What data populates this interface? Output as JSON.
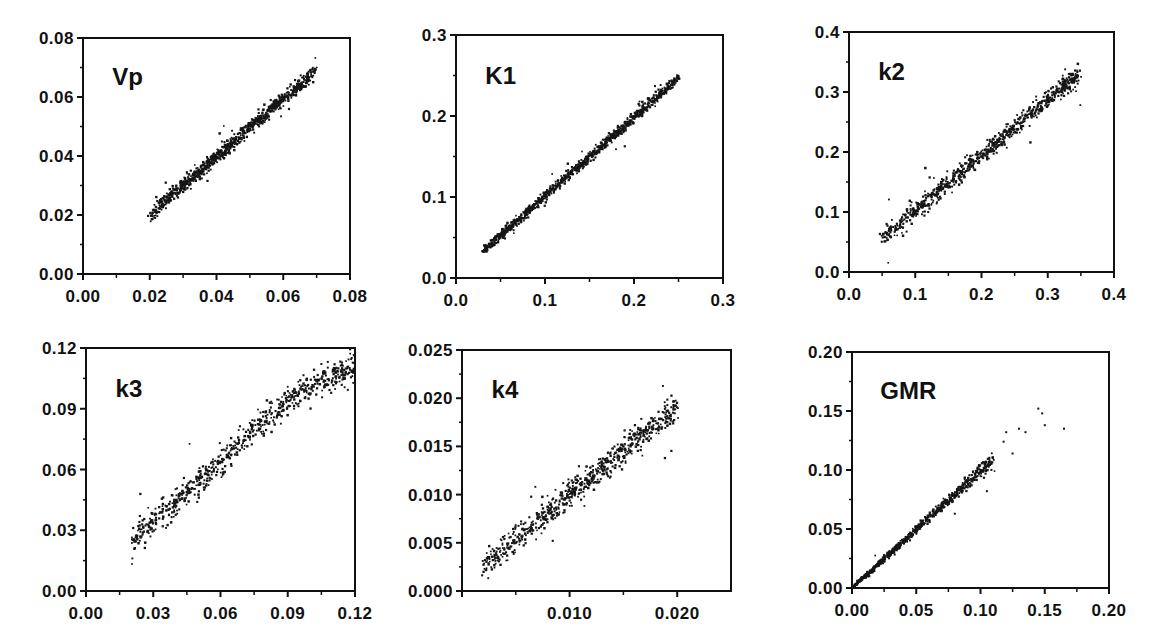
{
  "chart_data": [
    {
      "id": "vp",
      "type": "scatter",
      "title": "Vp",
      "box": [
        83,
        38,
        350,
        274
      ],
      "xlim": [
        0.0,
        0.08
      ],
      "ylim": [
        0.0,
        0.08
      ],
      "xticks": [
        0.0,
        0.02,
        0.04,
        0.06,
        0.08
      ],
      "xtick_labels": [
        "0.00",
        "0.02",
        "0.04",
        "0.06",
        "0.08"
      ],
      "yticks": [
        0.0,
        0.02,
        0.04,
        0.06,
        0.08
      ],
      "ytick_labels": [
        "0.00",
        "0.02",
        "0.04",
        "0.06",
        "0.08"
      ],
      "minor_x": [
        0.01,
        0.03,
        0.05,
        0.07
      ],
      "minor_y": [
        0.01,
        0.03,
        0.05,
        0.07
      ],
      "xlabel": "",
      "ylabel": "",
      "grid": false,
      "data_summary": {
        "x_range": [
          0.02,
          0.07
        ],
        "slope": 0.98,
        "intercept": 0.0005,
        "spread": 0.0012,
        "n_points": 900,
        "trend": "linear, tight"
      }
    },
    {
      "id": "k1",
      "type": "scatter",
      "title": "K1",
      "box": [
        456,
        35,
        723,
        278
      ],
      "xlim": [
        0.0,
        0.3
      ],
      "ylim": [
        0.0,
        0.3
      ],
      "xticks": [
        0.0,
        0.1,
        0.2,
        0.3
      ],
      "xtick_labels": [
        "0.0",
        "0.1",
        "0.2",
        "0.3"
      ],
      "yticks": [
        0.0,
        0.1,
        0.2,
        0.3
      ],
      "ytick_labels": [
        "0.0",
        "0.1",
        "0.2",
        "0.3"
      ],
      "minor_x": [
        0.05,
        0.15,
        0.25
      ],
      "minor_y": [
        0.05,
        0.15,
        0.25
      ],
      "xlabel": "",
      "ylabel": "",
      "grid": false,
      "data_summary": {
        "x_range": [
          0.03,
          0.25
        ],
        "slope": 0.97,
        "intercept": 0.004,
        "spread": 0.003,
        "n_points": 900,
        "trend": "linear, very tight"
      }
    },
    {
      "id": "k2",
      "type": "scatter",
      "title": "k2",
      "box": [
        849,
        32,
        1114,
        272
      ],
      "xlim": [
        0.0,
        0.4
      ],
      "ylim": [
        0.0,
        0.4
      ],
      "xticks": [
        0.0,
        0.1,
        0.2,
        0.3,
        0.4
      ],
      "xtick_labels": [
        "0.0",
        "0.1",
        "0.2",
        "0.3",
        "0.4"
      ],
      "yticks": [
        0.0,
        0.1,
        0.2,
        0.3,
        0.4
      ],
      "ytick_labels": [
        "0.0",
        "0.1",
        "0.2",
        "0.3",
        "0.4"
      ],
      "minor_x": [
        0.05,
        0.15,
        0.25,
        0.35
      ],
      "minor_y": [
        0.05,
        0.15,
        0.25,
        0.35
      ],
      "xlabel": "",
      "ylabel": "",
      "grid": false,
      "data_summary": {
        "x_range": [
          0.05,
          0.35
        ],
        "slope": 0.93,
        "intercept": 0.008,
        "spread": 0.008,
        "n_points": 800,
        "trend": "linear, moderate scatter"
      }
    },
    {
      "id": "k3",
      "type": "scatter",
      "title": "k3",
      "box": [
        86,
        348,
        355,
        591
      ],
      "xlim": [
        0.0,
        0.12
      ],
      "ylim": [
        0.0,
        0.12
      ],
      "xticks": [
        0.0,
        0.03,
        0.06,
        0.09,
        0.12
      ],
      "xtick_labels": [
        "0.00",
        "0.03",
        "0.06",
        "0.09",
        "0.12"
      ],
      "yticks": [
        0.0,
        0.03,
        0.06,
        0.09,
        0.12
      ],
      "ytick_labels": [
        "0.00",
        "0.03",
        "0.06",
        "0.09",
        "0.12"
      ],
      "minor_x": [
        0.015,
        0.045,
        0.075,
        0.105
      ],
      "minor_y": [
        0.015,
        0.045,
        0.075,
        0.105
      ],
      "xlabel": "",
      "ylabel": "",
      "grid": false,
      "data_summary": {
        "x_range": [
          0.02,
          0.12
        ],
        "curve": [
          [
            0.02,
            0.024
          ],
          [
            0.04,
            0.044
          ],
          [
            0.06,
            0.064
          ],
          [
            0.08,
            0.085
          ],
          [
            0.1,
            0.101
          ],
          [
            0.12,
            0.111
          ]
        ],
        "spread": 0.0035,
        "n_points": 700,
        "trend": "slightly concave, wider scatter"
      }
    },
    {
      "id": "k4",
      "type": "scatter",
      "title": "k4",
      "box": [
        462,
        350,
        731,
        591
      ],
      "xlim": [
        0.0,
        0.025
      ],
      "ylim": [
        0.0,
        0.025
      ],
      "xticks": [
        0.01,
        0.02
      ],
      "xtick_labels": [
        "0.010",
        "0.020"
      ],
      "yticks": [
        0.0,
        0.005,
        0.01,
        0.015,
        0.02,
        0.025
      ],
      "ytick_labels": [
        "0.000",
        "0.005",
        "0.010",
        "0.015",
        "0.020",
        "0.025"
      ],
      "minor_x": [
        0.005,
        0.015
      ],
      "minor_y": [
        0.0025,
        0.0075,
        0.0125,
        0.0175,
        0.0225
      ],
      "xlabel": "",
      "ylabel": "",
      "grid": false,
      "data_summary": {
        "x_range": [
          0.002,
          0.02
        ],
        "slope": 0.92,
        "intercept": 0.0008,
        "spread": 0.0007,
        "n_points": 700,
        "trend": "linear, moderate scatter"
      }
    },
    {
      "id": "gmr",
      "type": "scatter",
      "title": "GMR",
      "box": [
        852,
        352,
        1109,
        588
      ],
      "xlim": [
        0.0,
        0.2
      ],
      "ylim": [
        0.0,
        0.2
      ],
      "xticks": [
        0.0,
        0.05,
        0.1,
        0.15,
        0.2
      ],
      "xtick_labels": [
        "0.00",
        "0.05",
        "0.10",
        "0.15",
        "0.20"
      ],
      "yticks": [
        0.0,
        0.05,
        0.1,
        0.15,
        0.2
      ],
      "ytick_labels": [
        "0.00",
        "0.05",
        "0.10",
        "0.15",
        "0.20"
      ],
      "minor_x": [
        0.025,
        0.075,
        0.125,
        0.175
      ],
      "minor_y": [
        0.025,
        0.075,
        0.125,
        0.175
      ],
      "xlabel": "",
      "ylabel": "",
      "grid": false,
      "data_summary": {
        "x_range": [
          0.0,
          0.11
        ],
        "slope": 0.99,
        "intercept": 0.0,
        "spread": 0.0018,
        "n_points": 700,
        "outliers": [
          [
            0.145,
            0.152
          ],
          [
            0.148,
            0.148
          ],
          [
            0.15,
            0.138
          ],
          [
            0.165,
            0.135
          ],
          [
            0.13,
            0.135
          ],
          [
            0.12,
            0.132
          ],
          [
            0.125,
            0.114
          ],
          [
            0.118,
            0.124
          ],
          [
            0.105,
            0.082
          ],
          [
            0.135,
            0.132
          ],
          [
            0.08,
            0.063
          ]
        ],
        "trend": "linear, dense near origin, sparse tail"
      }
    }
  ]
}
